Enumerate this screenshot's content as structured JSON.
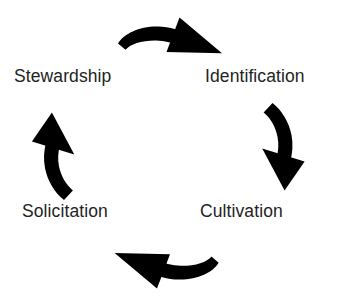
{
  "diagram": {
    "kind": "cycle-diagram",
    "direction": "clockwise",
    "background_color": "#ffffff",
    "text_color": "#232323",
    "arrow_color": "#000000",
    "stages": [
      {
        "id": "identification",
        "label": "Identification",
        "position": "top-right",
        "order": 1
      },
      {
        "id": "cultivation",
        "label": "Cultivation",
        "position": "bottom-right",
        "order": 2
      },
      {
        "id": "solicitation",
        "label": "Solicitation",
        "position": "bottom-left",
        "order": 3
      },
      {
        "id": "stewardship",
        "label": "Stewardship",
        "position": "top-left",
        "order": 4
      }
    ],
    "arrows": [
      {
        "id": "arrow-top",
        "from": "stewardship",
        "to": "identification",
        "points": "right"
      },
      {
        "id": "arrow-right",
        "from": "identification",
        "to": "cultivation",
        "points": "down"
      },
      {
        "id": "arrow-bottom",
        "from": "cultivation",
        "to": "solicitation",
        "points": "left"
      },
      {
        "id": "arrow-left",
        "from": "solicitation",
        "to": "stewardship",
        "points": "up"
      }
    ]
  }
}
